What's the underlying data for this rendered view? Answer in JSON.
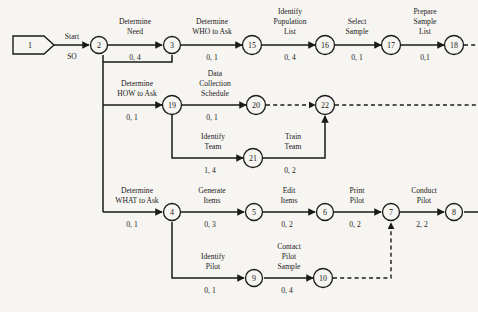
{
  "diagram": {
    "type": "activity-on-arrow-network",
    "title": "",
    "background_color": "#f7f5f1",
    "line_color": "#1a1a1a",
    "nodes": [
      {
        "id": "n1",
        "label": "1",
        "shape": "pentagon",
        "x": 32,
        "y": 45
      },
      {
        "id": "n2",
        "label": "2",
        "shape": "circle",
        "x": 99,
        "y": 45
      },
      {
        "id": "n3",
        "label": "3",
        "shape": "circle",
        "x": 172,
        "y": 45
      },
      {
        "id": "n15",
        "label": "15",
        "shape": "circle",
        "x": 252,
        "y": 45
      },
      {
        "id": "n16",
        "label": "16",
        "shape": "circle",
        "x": 325,
        "y": 45
      },
      {
        "id": "n17",
        "label": "17",
        "shape": "circle",
        "x": 391,
        "y": 45
      },
      {
        "id": "n18",
        "label": "18",
        "shape": "circle",
        "x": 454,
        "y": 45
      },
      {
        "id": "n19",
        "label": "19",
        "shape": "circle",
        "x": 172,
        "y": 105
      },
      {
        "id": "n20",
        "label": "20",
        "shape": "circle",
        "x": 256,
        "y": 105
      },
      {
        "id": "n22",
        "label": "22",
        "shape": "circle",
        "x": 325,
        "y": 105
      },
      {
        "id": "n21",
        "label": "21",
        "shape": "circle",
        "x": 253,
        "y": 158
      },
      {
        "id": "n4",
        "label": "4",
        "shape": "circle",
        "x": 172,
        "y": 212
      },
      {
        "id": "n5",
        "label": "5",
        "shape": "circle",
        "x": 254,
        "y": 212
      },
      {
        "id": "n6",
        "label": "6",
        "shape": "circle",
        "x": 325,
        "y": 212
      },
      {
        "id": "n7",
        "label": "7",
        "shape": "circle",
        "x": 391,
        "y": 212
      },
      {
        "id": "n8",
        "label": "8",
        "shape": "circle",
        "x": 454,
        "y": 212
      },
      {
        "id": "n9",
        "label": "9",
        "shape": "circle",
        "x": 254,
        "y": 278
      },
      {
        "id": "n10",
        "label": "10",
        "shape": "circle",
        "x": 323,
        "y": 278
      }
    ],
    "activities": [
      {
        "id": "a1",
        "from": "n1",
        "to": "n2",
        "name_lines": [
          "Start"
        ],
        "duration": "SO",
        "style": "solid"
      },
      {
        "id": "a2",
        "from": "n2",
        "to": "n3",
        "name_lines": [
          "Determine",
          "Need"
        ],
        "duration": "0, 4",
        "style": "solid"
      },
      {
        "id": "a3",
        "from": "n3",
        "to": "n15",
        "name_lines": [
          "Determine",
          "WHO to Ask"
        ],
        "duration": "0, 1",
        "style": "solid"
      },
      {
        "id": "a4",
        "from": "n15",
        "to": "n16",
        "name_lines": [
          "Identify",
          "Population",
          "List"
        ],
        "duration": "0, 4",
        "style": "solid"
      },
      {
        "id": "a5",
        "from": "n16",
        "to": "n17",
        "name_lines": [
          "Select",
          "Sample"
        ],
        "duration": "0, 1",
        "style": "solid"
      },
      {
        "id": "a6",
        "from": "n17",
        "to": "n18",
        "name_lines": [
          "Prepare",
          "Sample",
          "List"
        ],
        "duration": "0,1",
        "style": "solid"
      },
      {
        "id": "a7",
        "from": "n2",
        "to": "n19",
        "name_lines": [
          "Determine",
          "HOW to Ask"
        ],
        "duration": "0, 1",
        "style": "solid"
      },
      {
        "id": "a8",
        "from": "n19",
        "to": "n20",
        "name_lines": [
          "Data",
          "Collection",
          "Schedule"
        ],
        "duration": "0, 1",
        "style": "solid"
      },
      {
        "id": "a9",
        "from": "n19",
        "to": "n21",
        "name_lines": [
          "Identify",
          "Team"
        ],
        "duration": "1, 4",
        "style": "solid"
      },
      {
        "id": "a10",
        "from": "n21",
        "to": "n22",
        "name_lines": [
          "Train",
          "Team"
        ],
        "duration": "0, 2",
        "style": "solid"
      },
      {
        "id": "a11",
        "from": "n2",
        "to": "n4",
        "name_lines": [
          "Determine",
          "WHAT to Ask"
        ],
        "duration": "0, 1",
        "style": "solid"
      },
      {
        "id": "a12",
        "from": "n4",
        "to": "n5",
        "name_lines": [
          "Generate",
          "Items"
        ],
        "duration": "0, 3",
        "style": "solid"
      },
      {
        "id": "a13",
        "from": "n5",
        "to": "n6",
        "name_lines": [
          "Edit",
          "Items"
        ],
        "duration": "0, 2",
        "style": "solid"
      },
      {
        "id": "a14",
        "from": "n6",
        "to": "n7",
        "name_lines": [
          "Print",
          "Pilot"
        ],
        "duration": "0, 2",
        "style": "solid"
      },
      {
        "id": "a15",
        "from": "n7",
        "to": "n8",
        "name_lines": [
          "Conduct",
          "Pilot"
        ],
        "duration": "2, 2",
        "style": "solid"
      },
      {
        "id": "a16",
        "from": "n4",
        "to": "n9",
        "name_lines": [
          "Identify",
          "Pilot"
        ],
        "duration": "0, 1",
        "style": "solid"
      },
      {
        "id": "a17",
        "from": "n9",
        "to": "n10",
        "name_lines": [
          "Contact",
          "Pilot",
          "Sample"
        ],
        "duration": "0, 4",
        "style": "solid"
      },
      {
        "id": "a18",
        "from": "n20",
        "to": "n22",
        "name_lines": [],
        "duration": "",
        "style": "dashed"
      },
      {
        "id": "a19",
        "from": "n10",
        "to": "n7",
        "name_lines": [],
        "duration": "",
        "style": "dashed"
      }
    ],
    "text_labels": {
      "start": "Start",
      "so": "SO",
      "determine_need": "Determine",
      "determine_need_2": "Need",
      "determine_need_dur": "0, 4",
      "determine_who": "Determine",
      "determine_who_2": "WHO to Ask",
      "determine_who_dur": "0, 1",
      "identify_pop_1": "Identify",
      "identify_pop_2": "Population",
      "identify_pop_3": "List",
      "identify_pop_dur": "0, 4",
      "select_sample_1": "Select",
      "select_sample_2": "Sample",
      "select_sample_dur": "0, 1",
      "prepare_sample_1": "Prepare",
      "prepare_sample_2": "Sample",
      "prepare_sample_3": "List",
      "prepare_sample_dur": "0,1",
      "determine_how_1": "Determine",
      "determine_how_2": "HOW to Ask",
      "determine_how_dur": "0, 1",
      "data_coll_1": "Data",
      "data_coll_2": "Collection",
      "data_coll_3": "Schedule",
      "data_coll_dur": "0, 1",
      "identify_team_1": "Identify",
      "identify_team_2": "Team",
      "identify_team_dur": "1, 4",
      "train_team_1": "Train",
      "train_team_2": "Team",
      "train_team_dur": "0, 2",
      "determine_what_1": "Determine",
      "determine_what_2": "WHAT to Ask",
      "determine_what_dur": "0, 1",
      "generate_items_1": "Generate",
      "generate_items_2": "Items",
      "generate_items_dur": "0, 3",
      "edit_items_1": "Edit",
      "edit_items_2": "Items",
      "edit_items_dur": "0, 2",
      "print_pilot_1": "Print",
      "print_pilot_2": "Pilot",
      "print_pilot_dur": "0, 2",
      "conduct_pilot_1": "Conduct",
      "conduct_pilot_2": "Pilot",
      "conduct_pilot_dur": "2, 2",
      "identify_pilot_1": "Identify",
      "identify_pilot_2": "Pilot",
      "identify_pilot_dur": "0, 1",
      "contact_pilot_1": "Contact",
      "contact_pilot_2": "Pilot",
      "contact_pilot_3": "Sample",
      "contact_pilot_dur": "0, 4"
    },
    "node_labels": {
      "n1": "1",
      "n2": "2",
      "n3": "3",
      "n4": "4",
      "n5": "5",
      "n6": "6",
      "n7": "7",
      "n8": "8",
      "n9": "9",
      "n10": "10",
      "n15": "15",
      "n16": "16",
      "n17": "17",
      "n18": "18",
      "n19": "19",
      "n20": "20",
      "n21": "21",
      "n22": "22"
    }
  }
}
